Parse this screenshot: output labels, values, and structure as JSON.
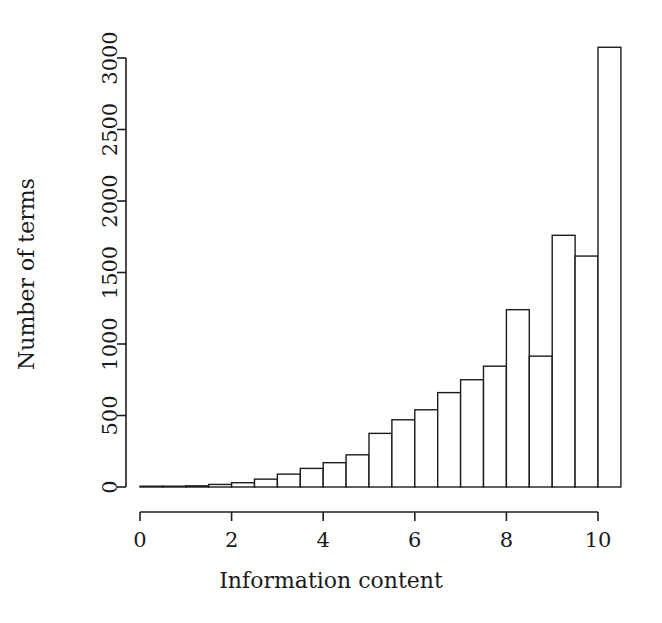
{
  "chart_data": {
    "type": "bar",
    "title": "",
    "subtitle": "",
    "xlabel": "Information content",
    "ylabel": "Number of terms",
    "xlim": [
      0,
      10.5
    ],
    "ylim": [
      0,
      3100
    ],
    "grid": false,
    "legend": null,
    "annotations": [],
    "bin_width": 0.5,
    "x_tick_labels": [
      "0",
      "2",
      "4",
      "6",
      "8",
      "10"
    ],
    "x_tick_values": [
      0,
      2,
      4,
      6,
      8,
      10
    ],
    "y_tick_labels": [
      "0",
      "500",
      "1000",
      "1500",
      "2000",
      "2500",
      "3000"
    ],
    "y_tick_values": [
      0,
      500,
      1000,
      1500,
      2000,
      2500,
      3000
    ],
    "categories": [
      "0.0-0.5",
      "0.5-1.0",
      "1.0-1.5",
      "1.5-2.0",
      "2.0-2.5",
      "2.5-3.0",
      "3.0-3.5",
      "3.5-4.0",
      "4.0-4.5",
      "4.5-5.0",
      "5.0-5.5",
      "5.5-6.0",
      "6.0-6.5",
      "6.5-7.0",
      "7.0-7.5",
      "7.5-8.0",
      "8.0-8.5",
      "8.5-9.0",
      "9.0-9.5",
      "9.5-10.0",
      "10.0-10.5"
    ],
    "bin_edges": [
      0,
      0.5,
      1,
      1.5,
      2,
      2.5,
      3,
      3.5,
      4,
      4.5,
      5,
      5.5,
      6,
      6.5,
      7,
      7.5,
      8,
      8.5,
      9,
      9.5,
      10,
      10.5
    ],
    "values": [
      2,
      4,
      8,
      18,
      30,
      55,
      90,
      130,
      170,
      225,
      375,
      470,
      540,
      660,
      750,
      845,
      1240,
      915,
      1760,
      1615,
      3075
    ]
  },
  "axes": {
    "x_title": "Information content",
    "y_title": "Number of terms"
  }
}
